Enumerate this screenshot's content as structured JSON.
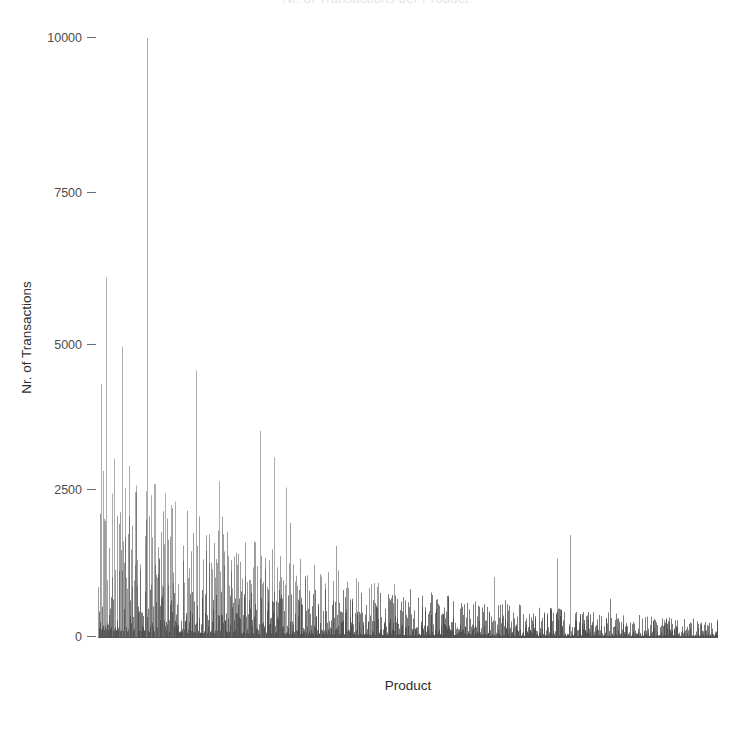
{
  "chart_data": {
    "type": "bar",
    "title": "Nr. of Transactions per Product",
    "xlabel": "Product",
    "ylabel": "Nr. of Transactions",
    "ylim": [
      0,
      10400
    ],
    "yticks": [
      0,
      2500,
      5000,
      7500,
      10000
    ],
    "ytick_labels": [
      "0",
      "2500",
      "5000",
      "7500",
      "10000"
    ],
    "xticks": [],
    "xtick_labels": [],
    "grid": false,
    "legend": null,
    "bar_color": "#4d4d4d",
    "background_color": "#ffffff",
    "n_categories": 1240,
    "categories": [
      "P1",
      "P2",
      "P3",
      "P4",
      "P5",
      "P6",
      "P7",
      "P8",
      "P9",
      "P10"
    ],
    "values": [
      10000,
      6000,
      3000,
      2600,
      2550,
      2500,
      2450,
      2300,
      2200,
      2100
    ],
    "notable_peaks": [
      {
        "x_fraction": 0.078,
        "value": 10000,
        "label": "tallest spike"
      },
      {
        "x_fraction": 0.013,
        "value": 6000,
        "label": "second peak"
      },
      {
        "x_fraction": 0.283,
        "value": 3000,
        "label": "mid-range peak"
      },
      {
        "x_fraction": 0.195,
        "value": 2600,
        "label": "peak"
      },
      {
        "x_fraction": 0.092,
        "value": 2550,
        "label": "peak"
      },
      {
        "x_fraction": 0.762,
        "value": 1700,
        "label": "right-side peak"
      }
    ]
  },
  "chart": {
    "title": "Nr. of Transactions per Product",
    "y_axis_title": "Nr. of Transactions",
    "x_axis_title": "Product",
    "y_tick_labels": [
      "10000",
      "7500",
      "5000",
      "2500",
      "0"
    ]
  }
}
